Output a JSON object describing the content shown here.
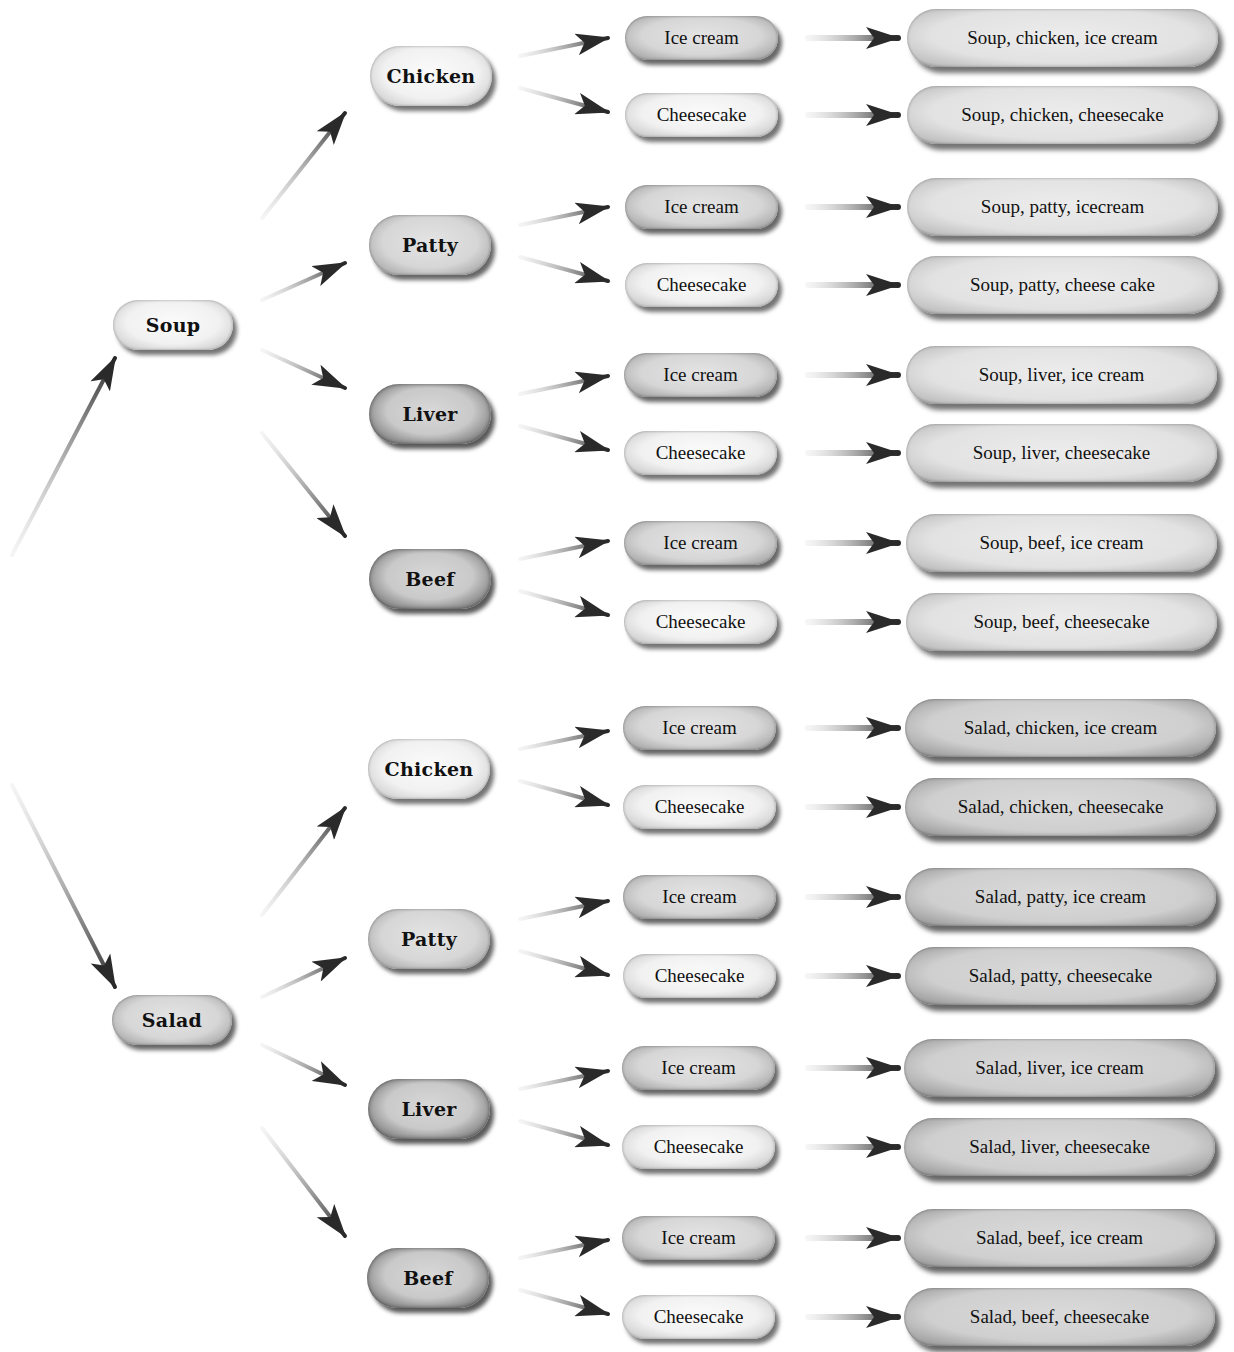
{
  "diagram": {
    "type": "tree-diagram",
    "roots": [
      {
        "label": "Soup",
        "children": [
          {
            "label": "Chicken",
            "children": [
              "Ice cream",
              "Cheesecake"
            ],
            "outcomes": [
              "Soup, chicken, ice cream",
              "Soup, chicken, cheesecake"
            ]
          },
          {
            "label": "Patty",
            "children": [
              "Ice cream",
              "Cheesecake"
            ],
            "outcomes": [
              "Soup, patty, icecream",
              "Soup, patty, cheese cake"
            ]
          },
          {
            "label": "Liver",
            "children": [
              "Ice cream",
              "Cheesecake"
            ],
            "outcomes": [
              "Soup, liver, ice cream",
              "Soup, liver, cheesecake"
            ]
          },
          {
            "label": "Beef",
            "children": [
              "Ice cream",
              "Cheesecake"
            ],
            "outcomes": [
              "Soup, beef, ice cream",
              "Soup, beef, cheesecake"
            ]
          }
        ]
      },
      {
        "label": "Salad",
        "children": [
          {
            "label": "Chicken",
            "children": [
              "Ice cream",
              "Cheesecake"
            ],
            "outcomes": [
              "Salad, chicken, ice cream",
              "Salad, chicken, cheesecake"
            ]
          },
          {
            "label": "Patty",
            "children": [
              "Ice cream",
              "Cheesecake"
            ],
            "outcomes": [
              "Salad, patty, ice cream",
              "Salad, patty, cheesecake"
            ]
          },
          {
            "label": "Liver",
            "children": [
              "Ice cream",
              "Cheesecake"
            ],
            "outcomes": [
              "Salad, liver, ice cream",
              "Salad, liver, cheesecake"
            ]
          },
          {
            "label": "Beef",
            "children": [
              "Ice cream",
              "Cheesecake"
            ],
            "outcomes": [
              "Salad, beef, ice cream",
              "Salad, beef, cheesecake"
            ]
          }
        ]
      }
    ]
  },
  "colors": {
    "background": "#ffffff",
    "text": "#111111",
    "arrow": "#2a2a2a",
    "pill_light": "#f1f1f1",
    "pill_mid": "#d6d6d6",
    "pill_dark": "#c9c9c9"
  }
}
